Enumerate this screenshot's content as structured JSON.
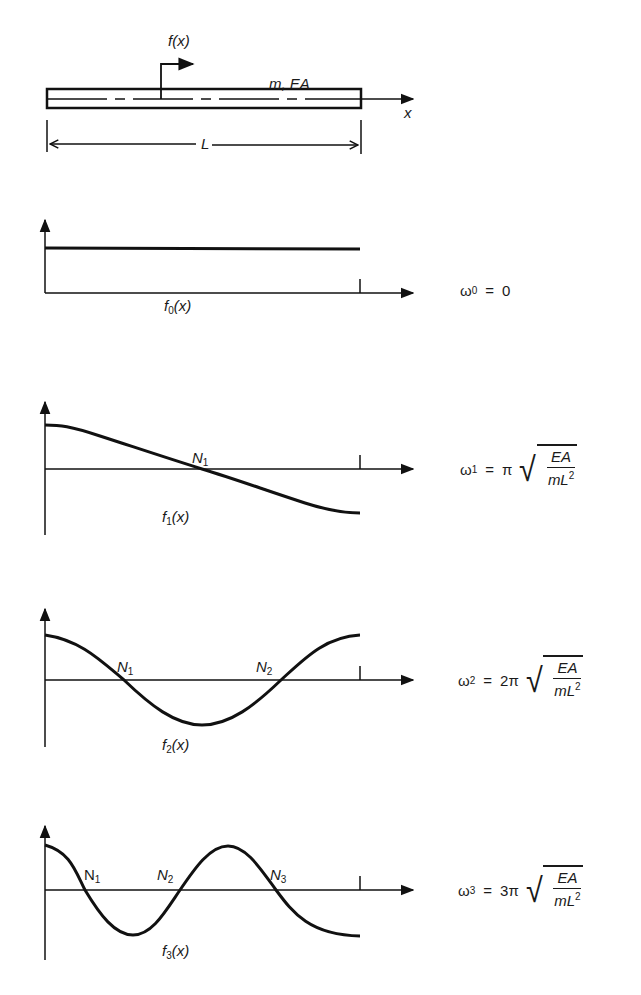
{
  "bar": {
    "force_label": "f(x)",
    "property_label": "m, EA",
    "axis_label": "x",
    "length_label": "L"
  },
  "modes": [
    {
      "shape_label": "f",
      "shape_sub": "0",
      "shape_arg": "(x)",
      "omega_sub": "0",
      "coef": "",
      "value": "0",
      "nodes": []
    },
    {
      "shape_label": "f",
      "shape_sub": "1",
      "shape_arg": "(x)",
      "omega_sub": "1",
      "coef": "π",
      "num": "EA",
      "den": "mL",
      "den_sup": "2",
      "nodes": [
        {
          "n": "N",
          "sub": "1"
        }
      ]
    },
    {
      "shape_label": "f",
      "shape_sub": "2",
      "shape_arg": "(x)",
      "omega_sub": "2",
      "coef": "2π",
      "num": "EA",
      "den": "mL",
      "den_sup": "2",
      "nodes": [
        {
          "n": "N",
          "sub": "1"
        },
        {
          "n": "N",
          "sub": "2"
        }
      ]
    },
    {
      "shape_label": "f",
      "shape_sub": "3",
      "shape_arg": "(x)",
      "omega_sub": "3",
      "coef": "3π",
      "num": "EA",
      "den": "mL",
      "den_sup": "2",
      "nodes": [
        {
          "n": "N",
          "sub": "1"
        },
        {
          "n": "N",
          "sub": "2"
        },
        {
          "n": "N",
          "sub": "3"
        }
      ]
    }
  ],
  "symbols": {
    "omega": "ω",
    "equals": "=",
    "sqrt": "√"
  }
}
